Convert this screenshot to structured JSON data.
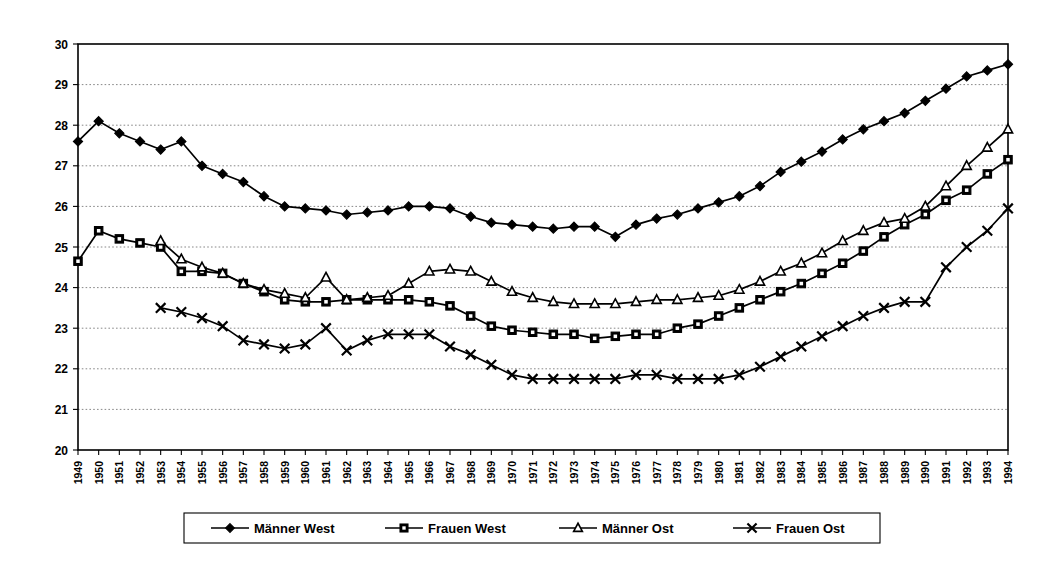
{
  "chart_data": {
    "type": "line",
    "title": "",
    "subtitle": "",
    "xlabel": "",
    "ylabel": "",
    "xlim": [
      1949,
      1994
    ],
    "ylim": [
      20,
      30
    ],
    "grid": true,
    "grid_axis": "y",
    "legend_position": "bottom",
    "y_ticks": [
      20,
      21,
      22,
      23,
      24,
      25,
      26,
      27,
      28,
      29,
      30
    ],
    "y_tick_labels": [
      "20",
      "21",
      "22",
      "23",
      "24",
      "25",
      "26",
      "27",
      "28",
      "29",
      "30"
    ],
    "categories": [
      "1949",
      "1950",
      "1951",
      "1952",
      "1953",
      "1954",
      "1955",
      "1956",
      "1957",
      "1958",
      "1959",
      "1960",
      "1961",
      "1962",
      "1963",
      "1964",
      "1965",
      "1966",
      "1967",
      "1968",
      "1969",
      "1970",
      "1971",
      "1972",
      "1973",
      "1974",
      "1975",
      "1976",
      "1977",
      "1978",
      "1979",
      "1980",
      "1981",
      "1982",
      "1983",
      "1984",
      "1985",
      "1986",
      "1987",
      "1988",
      "1989",
      "1990",
      "1991",
      "1992",
      "1993",
      "1994"
    ],
    "series": [
      {
        "name": "Männer West",
        "marker": "diamond",
        "x": [
          1949,
          1950,
          1951,
          1952,
          1953,
          1954,
          1955,
          1956,
          1957,
          1958,
          1959,
          1960,
          1961,
          1962,
          1963,
          1964,
          1965,
          1966,
          1967,
          1968,
          1969,
          1970,
          1971,
          1972,
          1973,
          1974,
          1975,
          1976,
          1977,
          1978,
          1979,
          1980,
          1981,
          1982,
          1983,
          1984,
          1985,
          1986,
          1987,
          1988,
          1989,
          1990,
          1991,
          1992,
          1993,
          1994
        ],
        "values": [
          27.6,
          28.1,
          27.8,
          27.6,
          27.4,
          27.6,
          27.0,
          26.8,
          26.6,
          26.25,
          26.0,
          25.95,
          25.9,
          25.8,
          25.85,
          25.9,
          26.0,
          26.0,
          25.95,
          25.75,
          25.6,
          25.55,
          25.5,
          25.45,
          25.5,
          25.5,
          25.25,
          25.55,
          25.7,
          25.8,
          25.95,
          26.1,
          26.25,
          26.5,
          26.85,
          27.1,
          27.35,
          27.65,
          27.9,
          28.1,
          28.3,
          28.6,
          28.9,
          29.2,
          29.35,
          29.5
        ]
      },
      {
        "name": "Frauen West",
        "marker": "square",
        "x": [
          1949,
          1950,
          1951,
          1952,
          1953,
          1954,
          1955,
          1956,
          1957,
          1958,
          1959,
          1960,
          1961,
          1962,
          1963,
          1964,
          1965,
          1966,
          1967,
          1968,
          1969,
          1970,
          1971,
          1972,
          1973,
          1974,
          1975,
          1976,
          1977,
          1978,
          1979,
          1980,
          1981,
          1982,
          1983,
          1984,
          1985,
          1986,
          1987,
          1988,
          1989,
          1990,
          1991,
          1992,
          1993,
          1994
        ],
        "values": [
          24.65,
          25.4,
          25.2,
          25.1,
          25.0,
          24.4,
          24.4,
          24.35,
          24.1,
          23.9,
          23.7,
          23.65,
          23.65,
          23.7,
          23.7,
          23.7,
          23.7,
          23.65,
          23.55,
          23.3,
          23.05,
          22.95,
          22.9,
          22.85,
          22.85,
          22.75,
          22.8,
          22.85,
          22.85,
          23.0,
          23.1,
          23.3,
          23.5,
          23.7,
          23.9,
          24.1,
          24.35,
          24.6,
          24.9,
          25.25,
          25.55,
          25.8,
          26.15,
          26.4,
          26.8,
          27.15
        ]
      },
      {
        "name": "Männer Ost",
        "marker": "triangle",
        "x": [
          1953,
          1954,
          1955,
          1956,
          1957,
          1958,
          1959,
          1960,
          1961,
          1962,
          1963,
          1964,
          1965,
          1966,
          1967,
          1968,
          1969,
          1970,
          1971,
          1972,
          1973,
          1974,
          1975,
          1976,
          1977,
          1978,
          1979,
          1980,
          1981,
          1982,
          1983,
          1984,
          1985,
          1986,
          1987,
          1988,
          1989,
          1990,
          1991,
          1992,
          1993,
          1994
        ],
        "values": [
          25.15,
          24.7,
          24.5,
          24.35,
          24.1,
          23.95,
          23.85,
          23.75,
          24.25,
          23.7,
          23.75,
          23.8,
          24.1,
          24.4,
          24.45,
          24.4,
          24.15,
          23.9,
          23.75,
          23.65,
          23.6,
          23.6,
          23.6,
          23.65,
          23.7,
          23.7,
          23.75,
          23.8,
          23.95,
          24.15,
          24.4,
          24.6,
          24.85,
          25.15,
          25.4,
          25.6,
          25.7,
          26.0,
          26.5,
          27.0,
          27.45,
          27.9
        ]
      },
      {
        "name": "Frauen Ost",
        "marker": "cross",
        "x": [
          1953,
          1954,
          1955,
          1956,
          1957,
          1958,
          1959,
          1960,
          1961,
          1962,
          1963,
          1964,
          1965,
          1966,
          1967,
          1968,
          1969,
          1970,
          1971,
          1972,
          1973,
          1974,
          1975,
          1976,
          1977,
          1978,
          1979,
          1980,
          1981,
          1982,
          1983,
          1984,
          1985,
          1986,
          1987,
          1988,
          1989,
          1990,
          1991,
          1992,
          1993,
          1994
        ],
        "values": [
          23.5,
          23.4,
          23.25,
          23.05,
          22.7,
          22.6,
          22.5,
          22.6,
          23.0,
          22.45,
          22.7,
          22.85,
          22.85,
          22.85,
          22.55,
          22.35,
          22.1,
          21.85,
          21.75,
          21.75,
          21.75,
          21.75,
          21.75,
          21.85,
          21.85,
          21.75,
          21.75,
          21.75,
          21.85,
          22.05,
          22.3,
          22.55,
          22.8,
          23.05,
          23.3,
          23.5,
          23.65,
          23.65,
          24.5,
          25.0,
          25.4,
          25.95
        ]
      }
    ],
    "legend_entries": [
      {
        "label": "Männer West",
        "marker": "diamond"
      },
      {
        "label": "Frauen West",
        "marker": "square"
      },
      {
        "label": "Männer Ost",
        "marker": "triangle"
      },
      {
        "label": "Frauen Ost",
        "marker": "cross"
      }
    ],
    "colors": {
      "line": "#000000",
      "grid": "#7a7a7a",
      "axis": "#000000",
      "background": "#ffffff"
    }
  }
}
